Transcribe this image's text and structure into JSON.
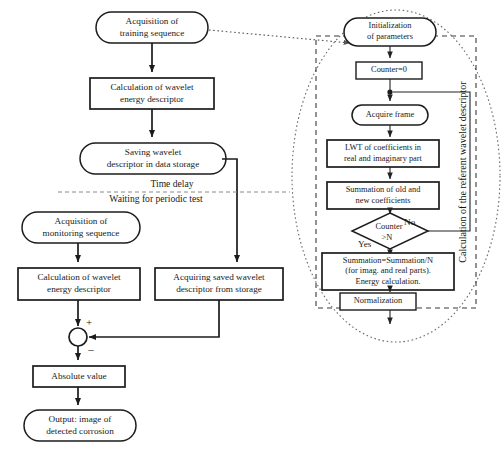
{
  "diagram": {
    "colors": {
      "stroke": "#1c1c1c",
      "dashed_region": "#3a3a3a",
      "dotted": "#6a6a6a",
      "background": "#ffffff"
    }
  },
  "left_branch": {
    "nodes": [
      {
        "id": "acq-training",
        "shape": "rounded",
        "lines": [
          "Acquisition of",
          "training sequence"
        ]
      },
      {
        "id": "calc-wavelet-1",
        "shape": "rect",
        "lines": [
          "Calculation of wavelet",
          "energy descriptor"
        ]
      },
      {
        "id": "saving-wavelet",
        "shape": "rounded",
        "lines": [
          "Saving wavelet",
          "descriptor in data storage"
        ]
      },
      {
        "id": "acq-monitoring",
        "shape": "rounded",
        "lines": [
          "Acquisition of",
          "monitoring sequence"
        ]
      },
      {
        "id": "calc-wavelet-2",
        "shape": "rect",
        "lines": [
          "Calculation of wavelet",
          "energy descriptor"
        ]
      },
      {
        "id": "acquiring-saved",
        "shape": "rect",
        "lines": [
          "Acquiring saved wavelet",
          "descriptor from storage"
        ]
      },
      {
        "id": "absolute-value",
        "shape": "rect",
        "lines": [
          "Absolute value"
        ]
      },
      {
        "id": "output-corrosion",
        "shape": "rounded",
        "lines": [
          "Output: image of",
          "detected corrosion"
        ]
      }
    ],
    "delay_divider": {
      "above_label": "Time delay",
      "below_label": "Waiting for periodic test"
    },
    "summing_junction": {
      "id": "summing-junction",
      "plus_sign": "+",
      "minus_sign": "–"
    }
  },
  "right_branch": {
    "region_caption": "Calculation of the referent wavelet descriptor",
    "nodes": [
      {
        "id": "init-params",
        "shape": "rounded",
        "lines": [
          "Initialization",
          "of parameters"
        ]
      },
      {
        "id": "counter-zero",
        "shape": "rect",
        "lines": [
          "Counter=0"
        ]
      },
      {
        "id": "acquire-frame",
        "shape": "rounded",
        "lines": [
          "Acquire frame"
        ]
      },
      {
        "id": "lwt-coefficients",
        "shape": "rect",
        "lines": [
          "LWT of coefficients in",
          "real and imaginary part"
        ]
      },
      {
        "id": "summation-old-new",
        "shape": "rect",
        "lines": [
          "Summation of old and",
          "new coefficients"
        ]
      },
      {
        "id": "counter-check",
        "shape": "diamond",
        "lines": [
          "Counter",
          ">N"
        ]
      },
      {
        "id": "summation-divide",
        "shape": "rect",
        "lines": [
          "Summation=Summation/N",
          "(for imag. and real parts).",
          "Energy calculation."
        ]
      },
      {
        "id": "normalization",
        "shape": "rect",
        "lines": [
          "Normalization"
        ]
      }
    ],
    "branch_labels": {
      "yes": "Yes",
      "no": "No"
    }
  }
}
